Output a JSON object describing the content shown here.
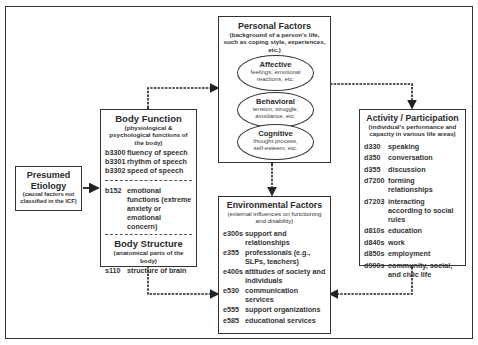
{
  "personal_factors": {
    "title": "Personal Factors",
    "subtitle": "(background of a person's life, such as  coping style, experiences, etc.)",
    "ellipses": [
      {
        "title": "Affective",
        "desc": "feelings, emotional reactions, etc."
      },
      {
        "title": "Behavioral",
        "desc": "tension, struggle, avoidance, etc."
      },
      {
        "title": "Cognitive",
        "desc": "thought process, self-esteem, etc."
      }
    ]
  },
  "body_function": {
    "title": "Body Function",
    "subtitle": "(physiological & psychological functions of the body)",
    "items": [
      {
        "code": "b3300",
        "label": "fluency of speech"
      },
      {
        "code": "b3301",
        "label": "rhythm of speech"
      },
      {
        "code": "b3302",
        "label": "speed of speech"
      }
    ],
    "items2": [
      {
        "code": "b152",
        "label": "emotional functions (extreme anxiety or emotional concern)"
      }
    ]
  },
  "body_structure": {
    "title": "Body Structure",
    "subtitle": "(anatomical parts of the body)",
    "items": [
      {
        "code": "s110",
        "label": "structure of brain"
      }
    ]
  },
  "etiology": {
    "title": "Presumed Etiology",
    "subtitle": "(causal factors not classified in the ICF)"
  },
  "environmental_factors": {
    "title": "Environmental Factors",
    "subtitle": "(external influences on functioning and disability)",
    "items": [
      {
        "code": "e300s",
        "label": "support and relationships"
      },
      {
        "code": "e355",
        "label": "professionals (e.g., SLPs, teachers)"
      },
      {
        "code": "e400s",
        "label": "attitudes of society and individuals"
      },
      {
        "code": "e530",
        "label": "communication services"
      },
      {
        "code": "e555",
        "label": "support organizations"
      },
      {
        "code": "e585",
        "label": "educational services"
      }
    ]
  },
  "activity_participation": {
    "title": "Activity / Participation",
    "subtitle": "(individual's performance and capacity in various life areas)",
    "items": [
      {
        "code": "d330",
        "label": "speaking"
      },
      {
        "code": "d350",
        "label": "conversation"
      },
      {
        "code": "d355",
        "label": "discussion"
      },
      {
        "code": "d7200",
        "label": "forming relationships"
      },
      {
        "code": "d7203",
        "label": "interacting according to social rules"
      },
      {
        "code": "d810s",
        "label": "education"
      },
      {
        "code": "d840s",
        "label": "work"
      },
      {
        "code": "d850s",
        "label": "employment"
      },
      {
        "code": "d900s",
        "label": "community, social, and civic life"
      }
    ]
  }
}
